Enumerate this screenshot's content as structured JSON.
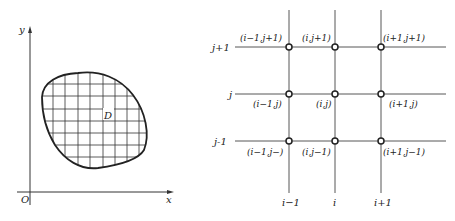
{
  "left_figure": {
    "axis_labels": {
      "y": "y",
      "x": "x",
      "origin": "O"
    },
    "region_label": "D",
    "colors": {
      "stroke": "#222222",
      "background": "#ffffff"
    }
  },
  "right_figure": {
    "row_labels": [
      "j+1",
      "j",
      "j-1"
    ],
    "column_labels": [
      "i−1",
      "i",
      "i+1"
    ],
    "node_labels": {
      "top": [
        "(i−1,j+1)",
        "(i,j+1)",
        "(i+1,j+1)"
      ],
      "middle": [
        "(i−1,j)",
        "(i,j)",
        "(i+1,j)"
      ],
      "bottom": [
        "(i−1,j−)",
        "(i,j−1)",
        "(i+1,j−1)"
      ]
    },
    "colors": {
      "line": "#444444",
      "node_fill": "#ffffff"
    }
  }
}
